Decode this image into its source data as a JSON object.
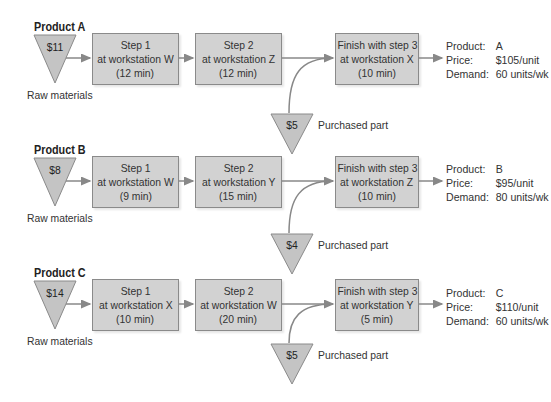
{
  "diagram": {
    "type": "process-flow",
    "raw_materials_label": "Raw materials",
    "purchased_part_label": "Purchased part",
    "info_keys": {
      "product": "Product:",
      "price": "Price:",
      "demand": "Demand:"
    },
    "colors": {
      "box_fill": "#d2d2d2",
      "box_border": "#8a8a8a",
      "triangle_fill": "#c4c4c4",
      "arrow": "#888888"
    },
    "products": [
      {
        "title": "Product A",
        "raw_cost": "$11",
        "steps": [
          {
            "line1": "Step 1",
            "line2": "at workstation W",
            "line3": "(12 min)"
          },
          {
            "line1": "Step 2",
            "line2": "at workstation Z",
            "line3": "(12 min)"
          },
          {
            "line1": "Finish with step 3",
            "line2": "at workstation X",
            "line3": "(10 min)"
          }
        ],
        "purchased_cost": "$5",
        "product": "A",
        "price": "$105/unit",
        "demand": "60 units/wk"
      },
      {
        "title": "Product B",
        "raw_cost": "$8",
        "steps": [
          {
            "line1": "Step 1",
            "line2": "at workstation W",
            "line3": "(9 min)"
          },
          {
            "line1": "Step 2",
            "line2": "at workstation Y",
            "line3": "(15 min)"
          },
          {
            "line1": "Finish with step 3",
            "line2": "at workstation Z",
            "line3": "(10 min)"
          }
        ],
        "purchased_cost": "$4",
        "product": "B",
        "price": "$95/unit",
        "demand": "80 units/wk"
      },
      {
        "title": "Product C",
        "raw_cost": "$14",
        "steps": [
          {
            "line1": "Step 1",
            "line2": "at workstation X",
            "line3": "(10 min)"
          },
          {
            "line1": "Step 2",
            "line2": "at workstation W",
            "line3": "(20 min)"
          },
          {
            "line1": "Finish with step 3",
            "line2": "at workstation Y",
            "line3": "(5 min)"
          }
        ],
        "purchased_cost": "$5",
        "product": "C",
        "price": "$110/unit",
        "demand": "60 units/wk"
      }
    ]
  }
}
